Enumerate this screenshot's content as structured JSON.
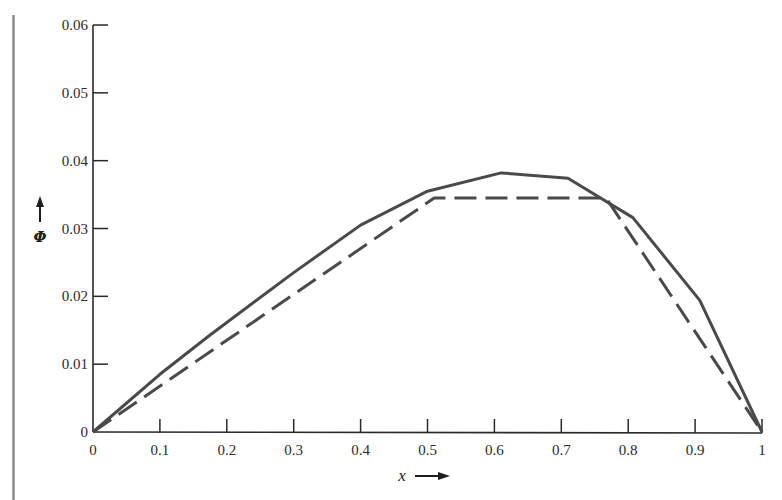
{
  "chart_data": {
    "type": "line",
    "title": "",
    "xlabel": "x",
    "ylabel": "Φ",
    "xlim": [
      0,
      1
    ],
    "ylim": [
      0,
      0.06
    ],
    "grid": false,
    "legend": null,
    "x_ticks": [
      "0",
      "0.1",
      "0.2",
      "0.3",
      "0.4",
      "0.5",
      "0.6",
      "0.7",
      "0.8",
      "0.9",
      "1"
    ],
    "y_ticks": [
      "0",
      "0.01",
      "0.02",
      "0.03",
      "0.04",
      "0.05",
      "0.06"
    ],
    "series": [
      {
        "name": "solid",
        "style": "solid",
        "x": [
          0,
          0.1,
          0.175,
          0.3,
          0.4,
          0.5,
          0.61,
          0.71,
          0.807,
          0.907,
          1.0
        ],
        "y": [
          0,
          0.0085,
          0.0143,
          0.0235,
          0.0305,
          0.0355,
          0.0382,
          0.0374,
          0.0316,
          0.0194,
          0
        ]
      },
      {
        "name": "dashed",
        "style": "dashed",
        "x": [
          0,
          0.51,
          0.767,
          1.0
        ],
        "y": [
          0,
          0.0345,
          0.0345,
          0
        ]
      }
    ]
  },
  "labels": {
    "x_axis": "x",
    "y_axis": "Φ"
  },
  "colors": {
    "line": "#4a4a4a",
    "axis": "#2a2a2a",
    "border": "#8a8a8a"
  }
}
